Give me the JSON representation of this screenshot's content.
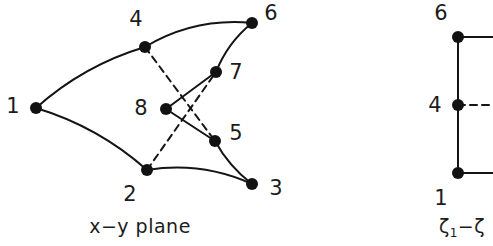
{
  "figure": {
    "stroke_color": "#141414",
    "node_color": "#121212",
    "background": "#ffffff",
    "left_panel": {
      "caption": "x−y  plane",
      "nodes": [
        {
          "id": "1",
          "label": "1",
          "x": 36,
          "y": 108,
          "label_x": 13,
          "label_y": 106
        },
        {
          "id": "2",
          "label": "2",
          "x": 147,
          "y": 170,
          "label_x": 130,
          "label_y": 194
        },
        {
          "id": "3",
          "label": "3",
          "x": 252,
          "y": 184,
          "label_x": 276,
          "label_y": 188
        },
        {
          "id": "4",
          "label": "4",
          "x": 145,
          "y": 47,
          "label_x": 136,
          "label_y": 19
        },
        {
          "id": "5",
          "label": "5",
          "x": 215,
          "y": 141,
          "label_x": 236,
          "label_y": 133
        },
        {
          "id": "6",
          "label": "6",
          "x": 252,
          "y": 23,
          "label_x": 271,
          "label_y": 13
        },
        {
          "id": "7",
          "label": "7",
          "x": 216,
          "y": 72,
          "label_x": 236,
          "label_y": 72
        },
        {
          "id": "8",
          "label": "8",
          "x": 166,
          "y": 109,
          "label_x": 141,
          "label_y": 108
        }
      ],
      "solid_edges": [
        {
          "from": "1",
          "to": "4",
          "curved": true,
          "bow": -7
        },
        {
          "from": "1",
          "to": "2",
          "curved": true,
          "bow": -7
        },
        {
          "from": "4",
          "to": "6",
          "curved": true,
          "bow": -9
        },
        {
          "from": "2",
          "to": "3",
          "curved": true,
          "bow": -8
        },
        {
          "from": "6",
          "to": "7",
          "curved": true,
          "bow": 4
        },
        {
          "from": "7",
          "to": "8",
          "curved": false,
          "bow": 0
        },
        {
          "from": "8",
          "to": "5",
          "curved": false,
          "bow": 0
        },
        {
          "from": "5",
          "to": "3",
          "curved": true,
          "bow": 3
        }
      ],
      "dashed_edges": [
        {
          "from": "4",
          "to": "5"
        },
        {
          "from": "2",
          "to": "7"
        }
      ]
    },
    "right_panel": {
      "caption_parts": {
        "first": "ζ",
        "first_sub": "1",
        "dash": "−",
        "second": "ζ"
      },
      "caption": "ζ1 − ζ",
      "nodes": [
        {
          "id": "6",
          "label": "6",
          "x": 458,
          "y": 37,
          "label_x": 441,
          "label_y": 13
        },
        {
          "id": "4",
          "label": "4",
          "x": 458,
          "y": 105,
          "label_x": 435,
          "label_y": 105
        },
        {
          "id": "1",
          "label": "1",
          "x": 458,
          "y": 173,
          "label_x": 441,
          "label_y": 198
        }
      ],
      "solid_edges": [
        {
          "from": "6",
          "to": "1",
          "vertical": true
        },
        {
          "from": "6",
          "to": "edge-right-top",
          "x2": 493,
          "y2": 37
        },
        {
          "from": "1",
          "to": "edge-right-bottom",
          "x2": 493,
          "y2": 173
        }
      ],
      "dashed_edges": [
        {
          "from": "4",
          "to": "edge-right-mid",
          "x2": 493,
          "y2": 105
        }
      ],
      "caption_x": 462,
      "caption_y": 228
    },
    "left_caption_x": 140,
    "left_caption_y": 226
  }
}
